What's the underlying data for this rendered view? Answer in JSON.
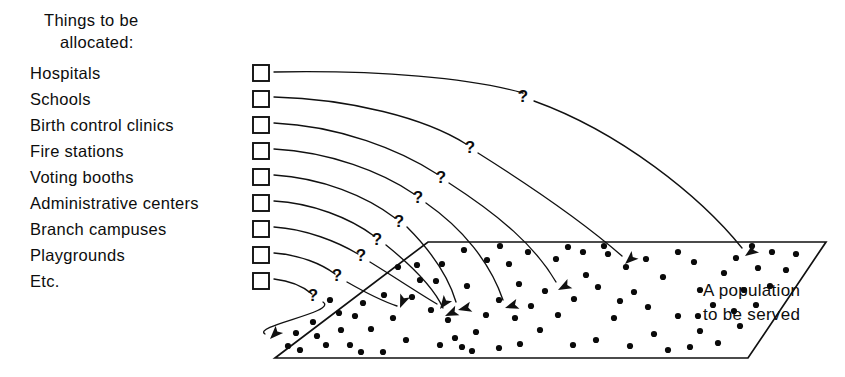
{
  "figure": {
    "type": "diagram",
    "title_lines": [
      "Things to be",
      "allocated:"
    ],
    "population_label_lines": [
      "A population",
      "to be served"
    ],
    "question_mark": "?",
    "colors": {
      "ink": "#111111",
      "paper": "#ffffff",
      "dot": "#0a0a0a"
    }
  },
  "list": {
    "heading_line1": "Things to be",
    "heading_line2": "allocated:",
    "items": [
      {
        "label": "Hospitals",
        "y": 73,
        "checkbox_x": 253,
        "checkbox_y": 65
      },
      {
        "label": "Schools",
        "y": 98,
        "checkbox_x": 253,
        "checkbox_y": 90
      },
      {
        "label": "Birth control clinics",
        "y": 124,
        "checkbox_x": 253,
        "checkbox_y": 116
      },
      {
        "label": "Fire stations",
        "y": 150,
        "checkbox_x": 253,
        "checkbox_y": 142
      },
      {
        "label": "Voting booths",
        "y": 176,
        "checkbox_x": 253,
        "checkbox_y": 168
      },
      {
        "label": "Administrative centers",
        "y": 202,
        "checkbox_x": 253,
        "checkbox_y": 194
      },
      {
        "label": "Branch campuses",
        "y": 228,
        "checkbox_x": 253,
        "checkbox_y": 220
      },
      {
        "label": "Playgrounds",
        "y": 254,
        "checkbox_x": 253,
        "checkbox_y": 246
      },
      {
        "label": "Etc.",
        "y": 280,
        "checkbox_x": 253,
        "checkbox_y": 272
      }
    ]
  },
  "population_area": {
    "shape": "parallelogram",
    "points": "428,242 826,242 748,358 275,358",
    "label_line1": "A population",
    "label_line2": "to be served",
    "label_x": 703,
    "label_y1": 296,
    "label_y2": 320,
    "dot_radius": 3.1,
    "dots": [
      [
        398,
        267
      ],
      [
        420,
        280
      ],
      [
        384,
        295
      ],
      [
        363,
        303
      ],
      [
        355,
        316
      ],
      [
        330,
        300
      ],
      [
        341,
        330
      ],
      [
        313,
        322
      ],
      [
        296,
        333
      ],
      [
        326,
        345
      ],
      [
        300,
        350
      ],
      [
        350,
        345
      ],
      [
        371,
        329
      ],
      [
        393,
        318
      ],
      [
        412,
        297
      ],
      [
        436,
        281
      ],
      [
        431,
        310
      ],
      [
        406,
        340
      ],
      [
        383,
        352
      ],
      [
        361,
        352
      ],
      [
        440,
        345
      ],
      [
        455,
        338
      ],
      [
        462,
        347
      ],
      [
        472,
        351
      ],
      [
        448,
        320
      ],
      [
        467,
        286
      ],
      [
        487,
        260
      ],
      [
        509,
        264
      ],
      [
        519,
        284
      ],
      [
        531,
        306
      ],
      [
        540,
        330
      ],
      [
        520,
        344
      ],
      [
        499,
        348
      ],
      [
        476,
        332
      ],
      [
        556,
        259
      ],
      [
        568,
        247
      ],
      [
        586,
        275
      ],
      [
        598,
        287
      ],
      [
        608,
        254
      ],
      [
        626,
        267
      ],
      [
        634,
        292
      ],
      [
        648,
        307
      ],
      [
        614,
        318
      ],
      [
        596,
        340
      ],
      [
        573,
        345
      ],
      [
        630,
        346
      ],
      [
        654,
        334
      ],
      [
        663,
        277
      ],
      [
        678,
        252
      ],
      [
        694,
        262
      ],
      [
        700,
        290
      ],
      [
        713,
        305
      ],
      [
        724,
        273
      ],
      [
        736,
        258
      ],
      [
        744,
        290
      ],
      [
        758,
        268
      ],
      [
        700,
        331
      ],
      [
        718,
        343
      ],
      [
        740,
        326
      ],
      [
        690,
        347
      ],
      [
        668,
        350
      ],
      [
        646,
        259
      ],
      [
        604,
        246
      ],
      [
        583,
        252
      ],
      [
        528,
        252
      ],
      [
        500,
        246
      ],
      [
        464,
        250
      ],
      [
        499,
        300
      ],
      [
        486,
        315
      ],
      [
        515,
        318
      ],
      [
        545,
        291
      ],
      [
        558,
        315
      ],
      [
        574,
        299
      ],
      [
        620,
        301
      ],
      [
        678,
        316
      ],
      [
        698,
        316
      ],
      [
        734,
        311
      ],
      [
        756,
        305
      ],
      [
        770,
        286
      ],
      [
        786,
        270
      ],
      [
        796,
        254
      ],
      [
        772,
        252
      ],
      [
        752,
        246
      ],
      [
        442,
        264
      ],
      [
        417,
        265
      ],
      [
        339,
        313
      ],
      [
        317,
        336
      ],
      [
        288,
        346
      ]
    ]
  },
  "arcs": [
    {
      "id": "arc-1",
      "from_item": "Hospitals",
      "path": "M 274 72 C 380 70, 470 78, 523 93",
      "path2": "M 534 101 C 620 132, 700 196, 742 248",
      "qx": 523,
      "qy": 102,
      "ax": 745,
      "ay": 256,
      "adeg": 55
    },
    {
      "id": "arc-2",
      "from_item": "Schools",
      "path": "M 274 97 C 350 99, 425 118, 466 144",
      "path2": "M 478 153 C 540 192, 590 228, 622 256",
      "qx": 470,
      "qy": 153,
      "ax": 625,
      "ay": 264,
      "adeg": 48
    },
    {
      "id": "arc-3",
      "from_item": "Birth control clinics",
      "path": "M 274 123 C 340 126, 400 150, 437 174",
      "path2": "M 449 183 C 500 216, 535 246, 556 282",
      "qx": 441,
      "qy": 183,
      "ax": 558,
      "ay": 290,
      "adeg": 62
    },
    {
      "id": "arc-4",
      "from_item": "Fire stations",
      "path": "M 274 149 C 330 152, 382 172, 414 194",
      "path2": "M 426 203 C 462 228, 490 262, 503 300",
      "qx": 418,
      "qy": 203,
      "ax": 505,
      "ay": 308,
      "adeg": 72
    },
    {
      "id": "arc-5",
      "from_item": "Voting booths",
      "path": "M 274 175 C 322 178, 366 196, 395 218",
      "path2": "M 407 227 C 430 250, 448 275, 456 302",
      "qx": 399,
      "qy": 227,
      "ax": 458,
      "ay": 310,
      "adeg": 76
    },
    {
      "id": "arc-6",
      "from_item": "Administrative centers",
      "path": "M 274 201 C 312 203, 350 218, 374 236",
      "path2": "M 386 245 C 412 266, 434 288, 443 308",
      "qx": 377,
      "qy": 245,
      "ax": 445,
      "ay": 316,
      "adeg": 66
    },
    {
      "id": "arc-7",
      "from_item": "Branch campuses",
      "path": "M 274 227 C 306 229, 338 242, 358 254",
      "path2": "M 370 262 C 396 278, 420 294, 437 304",
      "qx": 361,
      "qy": 261,
      "ax": 440,
      "ay": 309,
      "adeg": 36
    },
    {
      "id": "arc-8",
      "from_item": "Playgrounds",
      "path": "M 274 253 C 300 255, 322 264, 335 274",
      "path2": "M 347 282 C 368 294, 385 302, 397 306",
      "qx": 337,
      "qy": 281,
      "ax": 400,
      "ay": 308,
      "adeg": 22
    },
    {
      "id": "arc-9",
      "from_item": "Etc.",
      "path": "M 274 279 C 292 281, 305 288, 312 294",
      "path2": "M 323 302 C 338 312, 252 326, 265 334",
      "qx": 313,
      "qy": 301,
      "ax": 270,
      "ay": 339,
      "adeg": 44
    }
  ]
}
